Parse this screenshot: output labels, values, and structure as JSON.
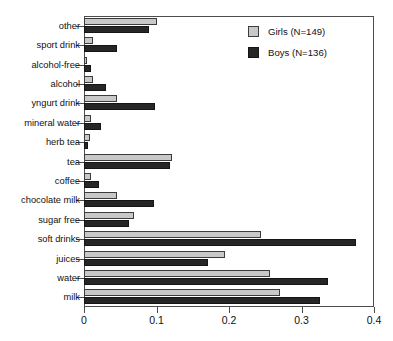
{
  "chart_data": {
    "type": "bar",
    "orientation": "horizontal",
    "title": "",
    "xlabel": "",
    "ylabel": "",
    "xlim": [
      0,
      0.4
    ],
    "xticks": [
      "0",
      "0.1",
      "0.2",
      "0.3",
      "0.4"
    ],
    "xtick_values": [
      0,
      0.1,
      0.2,
      0.3,
      0.4
    ],
    "grid": false,
    "legend_position": "top-right",
    "categories": [
      "other",
      "sport drink",
      "alcohol-free",
      "alcohol",
      "yngurt drink",
      "mineral water",
      "herb tea",
      "tea",
      "coffee",
      "chocolate milk",
      "sugar free",
      "soft drinks",
      "juices",
      "water",
      "milk"
    ],
    "series": [
      {
        "name": "Girls (N=149)",
        "color": "#c8c8c8",
        "values": [
          0.101,
          0.012,
          0.004,
          0.012,
          0.045,
          0.01,
          0.008,
          0.121,
          0.01,
          0.046,
          0.069,
          0.244,
          0.194,
          0.256,
          0.271
        ]
      },
      {
        "name": "Boys (N=136)",
        "color": "#262626",
        "values": [
          0.089,
          0.046,
          0.01,
          0.031,
          0.098,
          0.024,
          0.006,
          0.119,
          0.021,
          0.096,
          0.062,
          0.375,
          0.171,
          0.337,
          0.325
        ]
      }
    ],
    "legend": [
      {
        "label": "Girls (N=149)",
        "swatch": "girls"
      },
      {
        "label": "Boys (N=136)",
        "swatch": "boys"
      }
    ]
  }
}
